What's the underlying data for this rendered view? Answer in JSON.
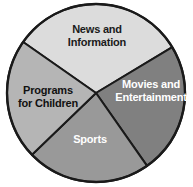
{
  "figure": {
    "background_color": "#ffffff",
    "outline_color": "#1a1a1a"
  },
  "chart_data": {
    "type": "pie",
    "title": "",
    "subtitle": "",
    "xlabel": "",
    "ylabel": "",
    "grid": false,
    "legend_position": "none",
    "labels_inside_slices": true,
    "center": {
      "x": 96,
      "y": 93
    },
    "radius": 89,
    "start_angle_deg": -145,
    "direction": "clockwise",
    "categories": [
      "News and\nInformation",
      "Movies and\nEntertainment",
      "Sports",
      "Programs\nfor Children"
    ],
    "values": [
      31,
      24,
      22,
      23
    ],
    "slices": [
      {
        "label": "News and\nInformation",
        "plain_label": "News and Information",
        "value": 31,
        "percent": 31,
        "start_angle_deg": -145,
        "end_angle_deg": -31,
        "color": "#dcdcdc",
        "text_color": "#1a1a1a"
      },
      {
        "label": "Movies and\nEntertainment",
        "plain_label": "Movies and Entertainment",
        "value": 24,
        "percent": 24,
        "start_angle_deg": -31,
        "end_angle_deg": 55,
        "color": "#808080",
        "text_color": "#ffffff"
      },
      {
        "label": "Sports",
        "plain_label": "Sports",
        "value": 22,
        "percent": 22,
        "start_angle_deg": 55,
        "end_angle_deg": 136,
        "color": "#999999",
        "text_color": "#ffffff"
      },
      {
        "label": "Programs\nfor Children",
        "plain_label": "Programs for Children",
        "value": 23,
        "percent": 23,
        "start_angle_deg": 136,
        "end_angle_deg": 215,
        "color": "#b5b5b5",
        "text_color": "#111111"
      }
    ]
  }
}
